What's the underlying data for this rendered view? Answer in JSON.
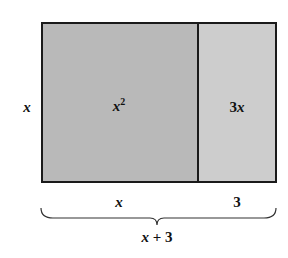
{
  "diagram": {
    "colors": {
      "large_region": "#b8b8b8",
      "small_region": "#cccccc",
      "border": "#1a1a1a"
    },
    "regions": [
      {
        "id": "x-squared",
        "label_base": "x",
        "label_exp": "2"
      },
      {
        "id": "three-x",
        "label_coef": "3",
        "label_var": "x"
      }
    ],
    "side_label": "x",
    "bottom_labels": [
      {
        "text": "x"
      },
      {
        "text": "3"
      }
    ],
    "brace_label": {
      "var": "x",
      "rest": " + 3"
    }
  }
}
